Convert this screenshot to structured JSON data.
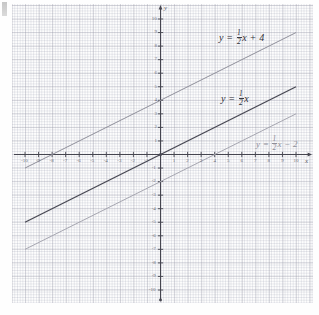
{
  "figure": {
    "type": "line",
    "axis_labels": {
      "x": "x",
      "y": "y"
    },
    "corner_marker": ""
  },
  "chart_data": {
    "type": "line",
    "title": "",
    "xlabel": "x",
    "ylabel": "y",
    "xlim": [
      -10,
      10
    ],
    "ylim": [
      -10,
      10
    ],
    "grid": true,
    "grid_minor": true,
    "legend": "inline-annotations",
    "xticks": [
      -10,
      -9,
      -8,
      -7,
      -6,
      -5,
      -4,
      -3,
      -2,
      -1,
      0,
      1,
      2,
      3,
      4,
      5,
      6,
      7,
      8,
      9,
      10
    ],
    "yticks": [
      -10,
      -9,
      -8,
      -7,
      -6,
      -5,
      -4,
      -3,
      -2,
      -1,
      0,
      1,
      2,
      3,
      4,
      5,
      6,
      7,
      8,
      9,
      10
    ],
    "series": [
      {
        "name": "y = 1/2 x + 4",
        "slope": 0.5,
        "intercept": 4,
        "color": "#8f8f9a",
        "x": [
          -10,
          10
        ],
        "values": [
          -1,
          9
        ]
      },
      {
        "name": "y = 1/2 x",
        "slope": 0.5,
        "intercept": 0,
        "color": "#4a4a55",
        "x": [
          -10,
          10
        ],
        "values": [
          -5,
          5
        ]
      },
      {
        "name": "y = 1/2 x - 2",
        "slope": 0.5,
        "intercept": -2,
        "color": "#a6a6b0",
        "x": [
          -10,
          10
        ],
        "values": [
          -7,
          3
        ]
      }
    ],
    "annotations": [
      {
        "id": "label-line-1",
        "y_text": "y",
        "eq": "=",
        "num": "1",
        "den": "2",
        "var": "x",
        "tail": "+ 4"
      },
      {
        "id": "label-line-2",
        "y_text": "y",
        "eq": "=",
        "num": "1",
        "den": "2",
        "var": "x",
        "tail": ""
      },
      {
        "id": "label-line-3",
        "y_text": "y",
        "eq": "=",
        "num": "1",
        "den": "2",
        "var": "x",
        "tail": "− 2"
      }
    ]
  },
  "ticks": {
    "x_negative": [
      "-10",
      "-9",
      "-8",
      "-7",
      "-6",
      "-5",
      "-4",
      "-3",
      "-2",
      "-1"
    ],
    "x_positive": [
      "1",
      "2",
      "3",
      "4",
      "5",
      "6",
      "7",
      "8",
      "9",
      "10"
    ],
    "y_positive": [
      "10",
      "9",
      "8",
      "7",
      "6",
      "5",
      "4",
      "3",
      "2",
      "1"
    ],
    "y_negative": [
      "-1",
      "-2",
      "-3",
      "-4",
      "-5",
      "-6",
      "-7",
      "-8",
      "-9",
      "-10"
    ]
  }
}
